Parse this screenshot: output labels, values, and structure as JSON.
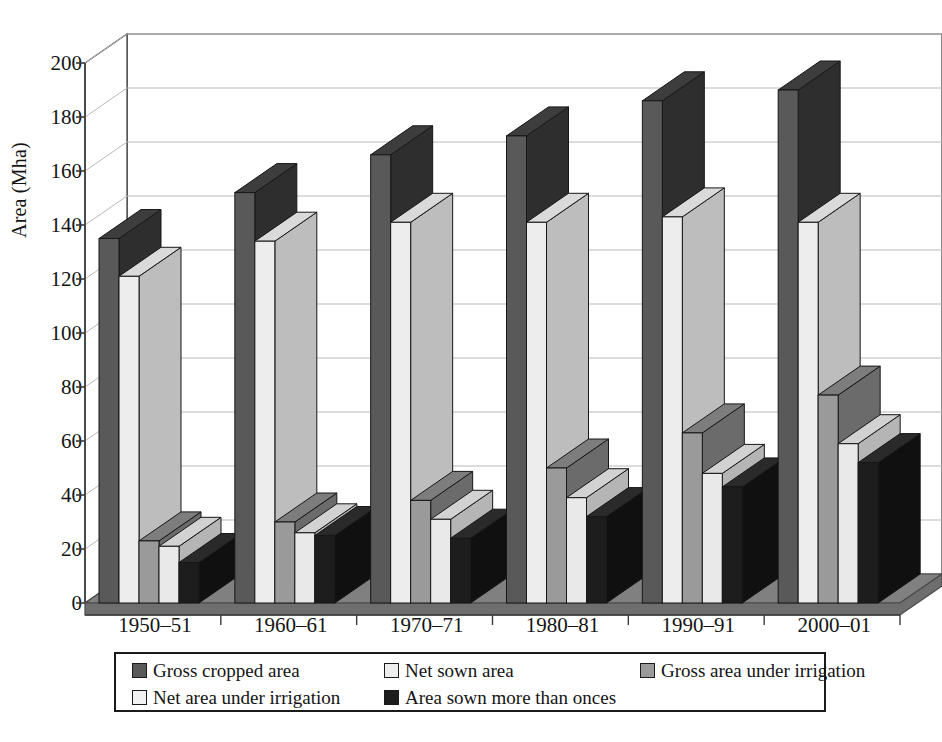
{
  "chart_data": {
    "type": "bar",
    "title": "",
    "subtitle": "",
    "xlabel": "",
    "ylabel": "Area (Mha)",
    "ylim": [
      0,
      200
    ],
    "ytick_step": 20,
    "yticks": [
      "0",
      "20",
      "40",
      "60",
      "80",
      "100",
      "120",
      "140",
      "160",
      "180",
      "200"
    ],
    "categories": [
      "1950–51",
      "1960–61",
      "1970–71",
      "1980–81",
      "1990–91",
      "2000–01"
    ],
    "grid": "horizontal",
    "legend_position": "bottom",
    "style": "3d-clustered-column",
    "series": [
      {
        "name": "Gross cropped area",
        "color": "#595959",
        "top_color": "#3d3d3d",
        "side_color": "#2e2e2e",
        "values": [
          135,
          152,
          166,
          173,
          186,
          190
        ]
      },
      {
        "name": "Net sown area",
        "color": "#ededed",
        "top_color": "#dadada",
        "side_color": "#bdbdbd",
        "values": [
          121,
          134,
          141,
          141,
          143,
          141
        ]
      },
      {
        "name": "Gross area under irrigation",
        "color": "#9a9a9a",
        "top_color": "#7d7d7d",
        "side_color": "#6b6b6b",
        "values": [
          23,
          30,
          38,
          50,
          63,
          77
        ]
      },
      {
        "name": "Net area under irrigation",
        "color": "#e9e9e9",
        "top_color": "#d2d2d2",
        "side_color": "#b5b5b5",
        "values": [
          21,
          26,
          31,
          39,
          48,
          59
        ]
      },
      {
        "name": "Area sown more than onces",
        "color": "#1d1d1d",
        "top_color": "#2a2a2a",
        "side_color": "#101010",
        "values": [
          15,
          25,
          24,
          32,
          43,
          52
        ]
      }
    ]
  },
  "legend": {
    "items": [
      {
        "label": "Gross cropped area",
        "color": "#595959"
      },
      {
        "label": "Net sown area",
        "color": "#ededed"
      },
      {
        "label": "Gross area under irrigation",
        "color": "#9a9a9a"
      },
      {
        "label": "Net area under irrigation",
        "color": "#f2f2f2"
      },
      {
        "label": "Area sown more than onces",
        "color": "#1d1d1d"
      }
    ]
  },
  "colors": {
    "axis": "#3a3a3a",
    "grid": "#b9b9b9",
    "floor": "#808080",
    "floor_edge": "#4a4a4a",
    "text": "#141414",
    "background": "#ffffff"
  }
}
